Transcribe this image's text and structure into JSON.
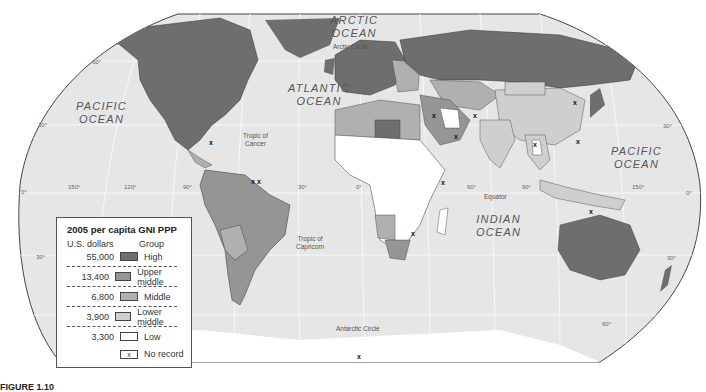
{
  "map": {
    "title": "2005 per capita GNI PPP",
    "oceans": [
      {
        "id": "arctic",
        "line1": "ARCTIC",
        "line2": "OCEAN"
      },
      {
        "id": "atlantic",
        "line1": "ATLANTIC",
        "line2": "OCEAN"
      },
      {
        "id": "pacific-west",
        "line1": "PACIFIC",
        "line2": "OCEAN"
      },
      {
        "id": "pacific-east",
        "line1": "PACIFIC",
        "line2": "OCEAN"
      },
      {
        "id": "indian",
        "line1": "INDIAN",
        "line2": "OCEAN"
      }
    ],
    "lines": {
      "arctic_circle": "Arctic Circle",
      "tropic_cancer_1": "Tropic of",
      "tropic_cancer_2": "Cancer",
      "tropic_capricorn_1": "Tropic of",
      "tropic_capricorn_2": "Capricorn",
      "equator": "Equator",
      "antarctic_circle": "Antarctic Circle"
    },
    "latitude_labels": {
      "lat60n_west": "60°",
      "lat30n_west": "30°",
      "lat0_west": "0°",
      "lat30s_west": "30°",
      "lat30n_east": "30°",
      "lat0_east": "0°",
      "lat30s_east": "30°",
      "lat60s_east": "60°"
    },
    "longitude_labels": {
      "lon150w": "150°",
      "lon120w": "120°",
      "lon90w": "90°",
      "lon30w": "30°",
      "lon0": "0°",
      "lon60e": "60°",
      "lon90e": "90°",
      "lon150e": "150°"
    },
    "no_record_marker": "x",
    "colors": {
      "ocean": "#e6e6e6",
      "high": "#6e6e6e",
      "upper_middle": "#959595",
      "middle": "#b0b0b0",
      "lower_middle": "#cfcfcf",
      "low": "#ffffff",
      "antarctica": "#ffffff",
      "border": "#333333"
    }
  },
  "legend": {
    "title": "2005 per capita GNI PPP",
    "col_dollars": "U.S. dollars",
    "col_group": "Group",
    "rows": [
      {
        "value": "55,000",
        "group": "High",
        "color": "#6e6e6e"
      },
      {
        "value": "13,400",
        "group": "Upper middle",
        "color": "#959595"
      },
      {
        "value": "6,800",
        "group": "Middle",
        "color": "#b0b0b0"
      },
      {
        "value": "3,900",
        "group": "Lower middle",
        "color": "#cfcfcf"
      },
      {
        "value": "3,300",
        "group": "Low",
        "color": "#ffffff"
      }
    ],
    "no_record_symbol": "x",
    "no_record_label": "No record"
  },
  "caption": {
    "label": "FIGURE 1.10"
  }
}
